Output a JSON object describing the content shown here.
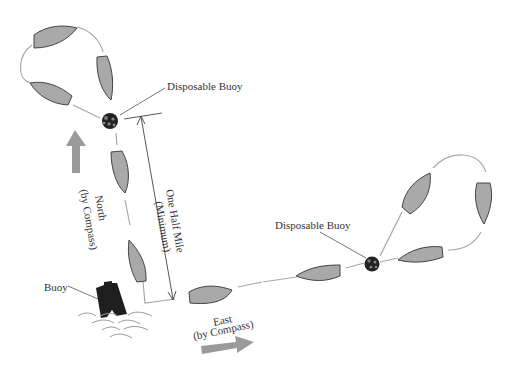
{
  "diagram": {
    "labels": {
      "disposable_buoy_1": "Disposable Buoy",
      "disposable_buoy_2": "Disposable Buoy",
      "buoy": "Buoy",
      "north_line1": "North",
      "north_line2": "(by Compass)",
      "east_line1": "East",
      "east_line2": "(by Compass)",
      "distance_line1": "One Half Mile",
      "distance_line2": "(Minimum)"
    },
    "colors": {
      "boat_fill": "#a9a9a9",
      "boat_stroke": "#444444",
      "track_line": "#a8a8a8",
      "direction_arrow": "#9a9a9a",
      "buoy_fill": "#222222",
      "text": "#333333"
    }
  }
}
